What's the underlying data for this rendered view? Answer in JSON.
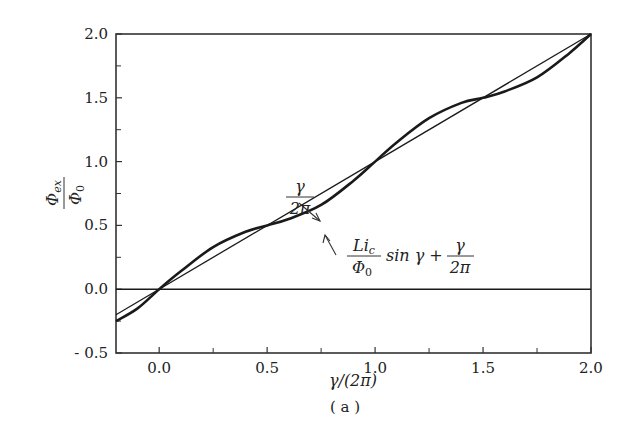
{
  "chart_data": {
    "type": "line",
    "title": "",
    "caption": "( a )",
    "xlabel": "γ/(2π)",
    "ylabel": "Φ_ex / Φ_0",
    "xlim": [
      -0.2,
      2.0
    ],
    "ylim": [
      -0.5,
      2.0
    ],
    "grid": false,
    "x_ticks": [
      "0.0",
      "0.5",
      "1.0",
      "1.5",
      "2.0"
    ],
    "x_minor_ticks": [
      0.25,
      0.75,
      1.25,
      1.75
    ],
    "y_ticks": [
      "- 0.5",
      "0.0",
      "0.5",
      "1.0",
      "1.5",
      "2.0"
    ],
    "y_minor_ticks": [
      -0.25,
      0.25,
      0.75,
      1.25,
      1.75
    ],
    "series": [
      {
        "name": "γ/(2π)",
        "style": "thin straight line",
        "x": [
          -0.2,
          2.0
        ],
        "y": [
          -0.2,
          2.0
        ]
      },
      {
        "name": "(L i_c / Φ_0) sin γ + γ/(2π)",
        "style": "thick wavy line",
        "x": [
          -0.2,
          -0.1,
          0.0,
          0.1,
          0.25,
          0.4,
          0.5,
          0.6,
          0.75,
          0.9,
          1.0,
          1.1,
          1.25,
          1.4,
          1.5,
          1.6,
          1.75,
          1.9,
          2.0
        ],
        "y": [
          -0.25,
          -0.15,
          0.0,
          0.14,
          0.33,
          0.45,
          0.5,
          0.55,
          0.66,
          0.85,
          1.0,
          1.15,
          1.34,
          1.46,
          1.5,
          1.55,
          1.66,
          1.85,
          2.0
        ]
      },
      {
        "name": "Φ_ex/Φ_0 = 0 reference",
        "style": "horizontal line",
        "x": [
          -0.2,
          2.0
        ],
        "y": [
          0.0,
          0.0
        ]
      }
    ],
    "annotations": [
      {
        "text": "γ / 2π",
        "points_to": "straight line near x=0.75"
      },
      {
        "text": "L i_c / Φ_0 sin γ + γ / 2π",
        "points_to": "wavy curve near x=0.75"
      }
    ]
  },
  "labels": {
    "x_axis": "γ/(2π)",
    "caption": "( a )",
    "annot1_num": "γ",
    "annot1_den": "2π",
    "annot2_num": "Li",
    "annot2_sub": "c",
    "annot2_den": "Φ",
    "annot2_den_sub": "0",
    "annot2_mid": "sin γ +",
    "annot2_frac_num": "γ",
    "annot2_frac_den": "2π",
    "ylab_num": "Φ",
    "ylab_num_sub": "ex",
    "ylab_den": "Φ",
    "ylab_den_sub": "0"
  }
}
